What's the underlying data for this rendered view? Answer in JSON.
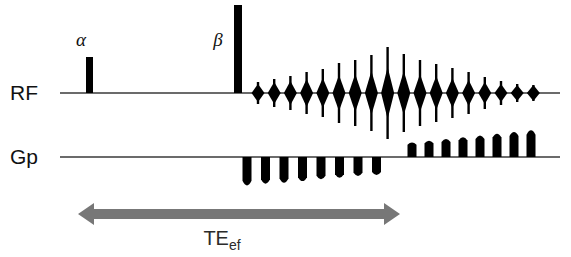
{
  "figure": {
    "type": "mri-pulse-sequence-diagram",
    "background_color": "#ffffff",
    "ink_color": "#000000",
    "arrow_color": "#777777"
  },
  "channels": [
    {
      "id": "rf",
      "label": "RF",
      "label_x": 10,
      "label_y": 100,
      "baseline_y": 93,
      "baseline_x_start": 60,
      "baseline_x_end": 560
    },
    {
      "id": "gp",
      "label": "Gp",
      "label_x": 10,
      "label_y": 164,
      "baseline_y": 157,
      "baseline_x_start": 60,
      "baseline_x_end": 560
    }
  ],
  "rf_pulses": [
    {
      "name": "alpha",
      "label": "α",
      "label_x": 81,
      "label_y": 46,
      "x": 86,
      "width": 7,
      "top_y": 57,
      "height": 36
    },
    {
      "name": "beta",
      "label": "β",
      "label_x": 218,
      "label_y": 46,
      "x": 234,
      "width": 8,
      "top_y": 5,
      "height": 88
    }
  ],
  "rf_echo_train": {
    "count": 18,
    "first_x": 258,
    "spacing": 16.2,
    "half_width": 6.5,
    "spike_half_width": 1.2,
    "amplitudes": [
      9,
      11,
      12,
      14,
      15,
      18,
      19,
      22,
      26,
      22,
      19,
      17,
      15,
      13,
      11,
      9,
      8,
      8
    ],
    "spike_heights": [
      11,
      14,
      17,
      21,
      24,
      30,
      33,
      38,
      46,
      39,
      33,
      29,
      25,
      21,
      16,
      12,
      9,
      8
    ]
  },
  "gp_lobes_down": {
    "count": 8,
    "first_x": 247,
    "spacing": 18.5,
    "width": 9,
    "depths": [
      33,
      31,
      30,
      28,
      26,
      24,
      22,
      21
    ]
  },
  "gp_lobes_up": {
    "count": 8,
    "first_x": 412,
    "spacing": 17.0,
    "width": 9,
    "heights": [
      17,
      19,
      21,
      23,
      25,
      27,
      29,
      31
    ]
  },
  "timing_arrow": {
    "name": "TE-ef-arrow",
    "y": 214,
    "x_left": 78,
    "x_right": 400,
    "thickness": 10,
    "head_length": 16,
    "head_half_height": 11,
    "color": "#777777",
    "label_main": "TE",
    "label_sub": "ef",
    "label_x": 222,
    "label_y": 245
  }
}
